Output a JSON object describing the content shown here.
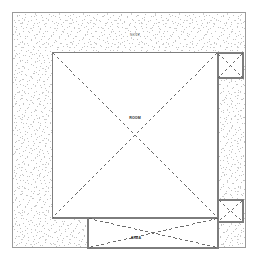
{
  "drawing": {
    "type": "architectural-plan",
    "canvas": {
      "width": 259,
      "height": 266
    },
    "background_color": "#ffffff",
    "line_color": "#8e8e8e",
    "heavy_line_color": "#6f6f6f",
    "dash_color": "#5a5a5a",
    "stipple_color": "#b9b9b9",
    "fill_color": "#ffffff"
  },
  "outer_boundary": {
    "name": "site-boundary",
    "x": 11.5,
    "y": 11.0,
    "width": 234.5,
    "height": 237.5
  },
  "stipple_region": {
    "name": "granular-fill-region",
    "description": "speckled stipple hatch between site boundary and interior rooms"
  },
  "rooms": [
    {
      "id": "main-hall",
      "label": "PLAN",
      "x": 52.0,
      "y": 52.0,
      "width": 166.0,
      "height": 166.0,
      "diagonals": "X",
      "label_x": 130.0,
      "label_y": 119.0
    },
    {
      "id": "upper-right-cell",
      "label": "",
      "x": 218.0,
      "y": 53.0,
      "width": 25.0,
      "height": 25.0,
      "diagonals": "X",
      "label_x": 230.5,
      "label_y": 65.5
    },
    {
      "id": "lower-right-cell",
      "label": "",
      "x": 218.0,
      "y": 200.0,
      "width": 25.0,
      "height": 22.0,
      "diagonals": "X",
      "label_x": 230.5,
      "label_y": 211.0
    },
    {
      "id": "lower-strip",
      "label": "SECTION",
      "x": 88.0,
      "y": 218.0,
      "width": 130.0,
      "height": 30.0,
      "diagonals": "X",
      "label_x": 136.0,
      "label_y": 239.0
    }
  ],
  "annotations": [
    {
      "id": "top-note",
      "text": "NOTE",
      "x": 135.0,
      "y": 36.0,
      "emphasis": "normal"
    },
    {
      "id": "center-note",
      "text": "ROOM",
      "x": 135.0,
      "y": 119.0,
      "emphasis": "strong"
    },
    {
      "id": "bottom-note",
      "text": "AREA",
      "x": 136.0,
      "y": 239.0,
      "emphasis": "strong"
    }
  ]
}
